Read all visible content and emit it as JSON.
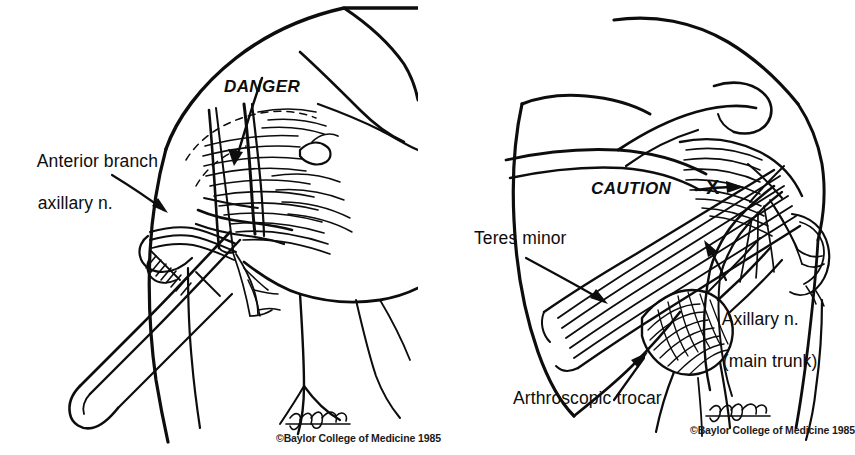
{
  "figure": {
    "background_color": "#ffffff",
    "ink_color": "#0d0d0d",
    "panels": [
      {
        "id": "left",
        "name": "anterior-approach-scalpel",
        "labels": [
          {
            "name": "danger-callout",
            "text": "DANGER",
            "style": "bold-italic"
          },
          {
            "name": "anterior-branch-label-line1",
            "text": "Anterior branch"
          },
          {
            "name": "anterior-branch-label-line2",
            "text": "axillary n."
          }
        ],
        "credit": {
          "signature": "T. Phelps",
          "copyright": "©Baylor College of Medicine 1985"
        }
      },
      {
        "id": "right",
        "name": "posterior-approach-trocar",
        "labels": [
          {
            "name": "caution-callout",
            "text": "CAUTION",
            "style": "bold-italic"
          },
          {
            "name": "x-marker",
            "text": "X",
            "style": "bold"
          },
          {
            "name": "teres-minor-label",
            "text": "Teres minor"
          },
          {
            "name": "axillary-nerve-label-line1",
            "text": "Axillary n."
          },
          {
            "name": "axillary-nerve-label-line2",
            "text": "(main trunk)"
          },
          {
            "name": "arthroscopic-trocar-label",
            "text": "Arthroscopic trocar"
          }
        ],
        "credit": {
          "signature": "T. Phelps",
          "copyright": "©Baylor College of Medicine 1985"
        }
      }
    ]
  }
}
